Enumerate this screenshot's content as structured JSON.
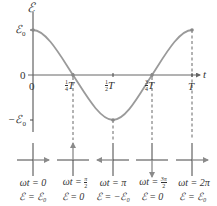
{
  "axes": {
    "y_label": "ℰ",
    "x_label": "t",
    "y_ticks": [
      {
        "label": "ℰ₀",
        "value": 1
      },
      {
        "label": "0",
        "value": 0
      },
      {
        "label": "−ℰ₀",
        "value": -1
      }
    ],
    "x_ticks": [
      {
        "label": "0",
        "fraction": "",
        "value": 0
      },
      {
        "label": "T",
        "fraction": "1/4",
        "value": 0.25
      },
      {
        "label": "T",
        "fraction": "1/2",
        "value": 0.5
      },
      {
        "label": "T",
        "fraction": "3/4",
        "value": 0.75
      },
      {
        "label": "T",
        "fraction": "",
        "value": 1
      }
    ]
  },
  "curve": {
    "type": "cosine",
    "amplitude_label": "ℰ₀",
    "color": "#9a9a9a",
    "marked_points": [
      {
        "t": 0,
        "value": 1
      },
      {
        "t": 0.25,
        "value": 0
      },
      {
        "t": 0.5,
        "value": -1
      },
      {
        "t": 0.75,
        "value": 0
      },
      {
        "t": 1,
        "value": 1
      }
    ]
  },
  "phasors": [
    {
      "direction": "right",
      "phase_label": "ωt = 0",
      "emf_label": "ℰ = ℰ₀"
    },
    {
      "direction": "up",
      "phase_label": "ωt = π/2",
      "emf_label": "ℰ = 0"
    },
    {
      "direction": "left",
      "phase_label": "ωt = π",
      "emf_label": "ℰ = −ℰ₀"
    },
    {
      "direction": "down",
      "phase_label": "ωt = 3π/2",
      "emf_label": "ℰ = 0"
    },
    {
      "direction": "right",
      "phase_label": "ωt = 2π",
      "emf_label": "ℰ = ℰ₀"
    }
  ],
  "labels": {
    "y_axis": "ℰ",
    "x_axis": "t",
    "e0": "ℰ",
    "e0_sub": "0",
    "neg_e0": "−ℰ",
    "neg_e0_sub": "0",
    "zero_y": "0",
    "zero_x": "0",
    "quarter_num": "1",
    "quarter_den": "4",
    "half_num": "1",
    "half_den": "2",
    "threequarter_num": "3",
    "threequarter_den": "4",
    "T": "T",
    "cap1_top": "ωt = 0",
    "cap1_bot": "ℰ = ℰ₀",
    "cap2_top_pre": "ωt = ",
    "cap2_num": "π",
    "cap2_den": "2",
    "cap2_bot": "ℰ = 0",
    "cap3_top": "ωt = π",
    "cap3_bot": "ℰ = −ℰ₀",
    "cap4_top_pre": "ωt = ",
    "cap4_num": "3π",
    "cap4_den": "2",
    "cap4_bot": "ℰ = 0",
    "cap5_top": "ωt = 2π",
    "cap5_bot": "ℰ = ℰ₀"
  }
}
